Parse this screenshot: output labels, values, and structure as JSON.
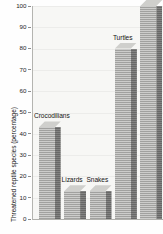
{
  "chart_data": {
    "type": "bar",
    "title": "",
    "subtitle": "",
    "xlabel": "",
    "ylabel": "Threatened reptile species (percentage)",
    "ylim": [
      0,
      100
    ],
    "yticks": [
      0,
      10,
      20,
      30,
      40,
      50,
      60,
      70,
      80,
      90,
      100
    ],
    "ytick_labels": [
      "0",
      "10",
      "20",
      "30",
      "40",
      "50",
      "60",
      "70",
      "80",
      "90",
      "100"
    ],
    "grid": true,
    "legend": "none",
    "style": "3d-bar-grayscale",
    "categories": [
      "Crocodilians",
      "Lizards",
      "Snakes",
      "Turtles",
      "Tuataras"
    ],
    "values": [
      43,
      13,
      13,
      80,
      100
    ],
    "bar_labels": [
      {
        "text": "Crocodilians",
        "value": 43
      },
      {
        "text": "Lizards",
        "value": 13
      },
      {
        "text": "Snakes",
        "value": 13
      },
      {
        "text": "Turtles",
        "value": 80
      },
      {
        "text": "Tuataras",
        "value": 100
      }
    ],
    "colors": {
      "bar_front": "#a8a8a6",
      "bar_side": "#6f6f6e",
      "bar_top": "#cfcfcc",
      "plot_background": "#f7f7f5",
      "gridline": "#ececea",
      "axis": "#b0b0ac",
      "text": "#141414"
    }
  }
}
